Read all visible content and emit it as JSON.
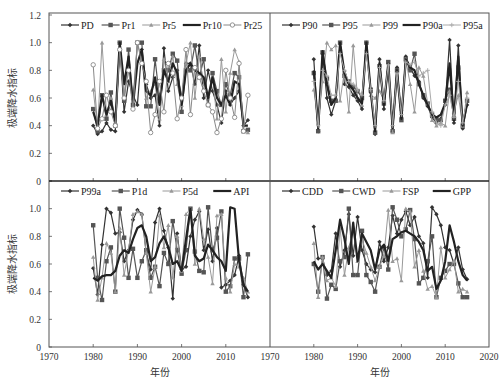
{
  "chart_data": [
    {
      "type": "line",
      "panel": "top-left",
      "title": "",
      "xlabel": "",
      "ylabel": "极端降水指标",
      "xlim": [
        1970,
        2020
      ],
      "ylim": [
        0,
        1.2
      ],
      "yticks": [
        "0",
        "0.2",
        "0.4",
        "0.6",
        "0.8",
        "1.0",
        "1.2"
      ],
      "xticks": [],
      "grid": false,
      "legend_position": "top",
      "x": [
        1980,
        1981,
        1982,
        1983,
        1984,
        1985,
        1986,
        1987,
        1988,
        1989,
        1990,
        1991,
        1992,
        1993,
        1994,
        1995,
        1996,
        1997,
        1998,
        1999,
        2000,
        2001,
        2002,
        2003,
        2004,
        2005,
        2006,
        2007,
        2008,
        2009,
        2010,
        2011,
        2012,
        2013,
        2014,
        2015
      ],
      "series": [
        {
          "name": "PD",
          "marker": "diamond",
          "color": "#333333",
          "width": 1.2,
          "values": [
            0.4,
            0.34,
            0.36,
            0.42,
            0.37,
            0.36,
            1.0,
            0.5,
            0.72,
            0.62,
            0.55,
            0.95,
            0.7,
            0.6,
            0.62,
            0.4,
            0.96,
            0.65,
            0.75,
            0.8,
            0.6,
            0.85,
            0.85,
            0.7,
            0.98,
            0.6,
            0.8,
            0.65,
            0.55,
            0.42,
            0.65,
            0.55,
            0.6,
            0.65,
            0.4,
            0.44
          ]
        },
        {
          "name": "Pr1",
          "marker": "square",
          "color": "#555555",
          "width": 1.2,
          "values": [
            0.52,
            0.36,
            0.62,
            0.45,
            0.64,
            0.4,
            1.0,
            0.58,
            0.95,
            0.55,
            1.0,
            1.0,
            0.54,
            0.54,
            0.88,
            0.6,
            0.8,
            0.8,
            0.92,
            0.87,
            0.5,
            0.8,
            0.8,
            0.98,
            0.75,
            0.88,
            0.55,
            0.78,
            0.65,
            0.55,
            0.7,
            0.62,
            0.78,
            0.75,
            0.36,
            0.37
          ]
        },
        {
          "name": "Pr5",
          "marker": "triangle",
          "color": "#999999",
          "width": 1.0,
          "values": [
            0.66,
            0.38,
            1.0,
            0.48,
            0.6,
            0.42,
            0.95,
            0.62,
            0.85,
            0.6,
            1.0,
            0.88,
            0.6,
            0.65,
            0.7,
            0.45,
            0.88,
            0.72,
            0.9,
            0.7,
            0.55,
            0.85,
            1.0,
            0.6,
            0.9,
            0.7,
            0.62,
            0.75,
            0.45,
            0.88,
            0.5,
            0.78,
            0.95,
            0.86,
            0.36,
            0.35
          ]
        },
        {
          "name": "Pr10",
          "marker": "none",
          "color": "#222222",
          "width": 2.2,
          "values": [
            0.5,
            0.4,
            0.62,
            0.48,
            0.58,
            0.42,
            1.0,
            0.7,
            0.9,
            0.55,
            0.85,
            0.95,
            0.65,
            0.62,
            0.75,
            0.55,
            0.8,
            0.72,
            0.85,
            0.78,
            0.55,
            0.8,
            0.85,
            0.8,
            0.78,
            0.75,
            0.6,
            0.75,
            0.6,
            0.55,
            0.62,
            0.55,
            0.72,
            0.7,
            0.4,
            0.4
          ]
        },
        {
          "name": "Pr25",
          "marker": "circle",
          "color": "#888888",
          "width": 1.0,
          "values": [
            0.84,
            0.38,
            0.45,
            0.62,
            0.5,
            0.4,
            0.95,
            0.6,
            0.8,
            0.52,
            1.0,
            0.85,
            0.72,
            0.35,
            0.48,
            0.72,
            0.5,
            0.85,
            0.78,
            0.45,
            0.6,
            0.95,
            0.48,
            0.82,
            0.75,
            0.65,
            0.55,
            0.5,
            0.35,
            0.45,
            0.8,
            0.6,
            0.46,
            0.85,
            0.36,
            0.62
          ]
        }
      ]
    },
    {
      "type": "line",
      "panel": "top-right",
      "title": "",
      "xlabel": "",
      "ylabel": "",
      "xlim": [
        1970,
        2020
      ],
      "ylim": [
        0,
        1.2
      ],
      "yticks": [],
      "xticks": [],
      "grid": false,
      "legend_position": "top",
      "x": [
        1980,
        1981,
        1982,
        1983,
        1984,
        1985,
        1986,
        1987,
        1988,
        1989,
        1990,
        1991,
        1992,
        1993,
        1994,
        1995,
        1996,
        1997,
        1998,
        1999,
        2000,
        2001,
        2002,
        2003,
        2004,
        2005,
        2006,
        2007,
        2008,
        2009,
        2010,
        2011,
        2012,
        2013,
        2014,
        2015
      ],
      "series": [
        {
          "name": "P90",
          "marker": "diamond",
          "color": "#333333",
          "width": 1.2,
          "values": [
            0.88,
            0.36,
            0.92,
            0.6,
            0.48,
            0.58,
            1.0,
            0.7,
            0.68,
            0.62,
            0.58,
            0.52,
            1.0,
            0.64,
            0.34,
            0.88,
            0.52,
            0.85,
            0.36,
            0.82,
            0.46,
            0.9,
            0.82,
            0.76,
            0.72,
            0.6,
            0.54,
            0.46,
            0.42,
            0.45,
            0.55,
            1.02,
            0.42,
            0.98,
            0.38,
            0.55
          ]
        },
        {
          "name": "P95",
          "marker": "square",
          "color": "#555555",
          "width": 1.2,
          "values": [
            0.78,
            0.36,
            0.93,
            0.74,
            0.58,
            0.58,
            1.0,
            0.76,
            0.72,
            0.68,
            0.65,
            0.6,
            1.0,
            0.66,
            0.35,
            0.83,
            0.56,
            0.86,
            0.36,
            0.8,
            0.44,
            0.88,
            0.8,
            0.92,
            0.7,
            0.62,
            0.56,
            0.48,
            0.45,
            0.44,
            0.58,
            0.66,
            0.45,
            0.82,
            0.4,
            0.58
          ]
        },
        {
          "name": "P99",
          "marker": "triangle",
          "color": "#999999",
          "width": 1.0,
          "values": [
            0.66,
            0.42,
            0.72,
            1.0,
            0.95,
            0.98,
            0.58,
            0.8,
            0.5,
            0.98,
            0.6,
            0.55,
            0.95,
            0.62,
            0.6,
            0.65,
            0.58,
            0.8,
            0.35,
            0.74,
            0.52,
            0.88,
            0.7,
            0.5,
            0.82,
            0.76,
            0.56,
            0.44,
            0.4,
            0.42,
            0.4,
            0.65,
            0.5,
            0.62,
            0.4,
            0.64
          ]
        },
        {
          "name": "P90a",
          "marker": "none",
          "color": "#222222",
          "width": 2.2,
          "values": [
            0.8,
            0.38,
            0.94,
            0.7,
            0.55,
            0.6,
            1.0,
            0.78,
            0.7,
            0.66,
            0.6,
            0.56,
            1.0,
            0.65,
            0.36,
            0.85,
            0.55,
            0.85,
            0.38,
            0.8,
            0.45,
            0.88,
            0.82,
            0.8,
            0.7,
            0.62,
            0.55,
            0.48,
            0.46,
            0.48,
            0.56,
            0.85,
            0.44,
            0.9,
            0.4,
            0.56
          ]
        },
        {
          "name": "P95a",
          "marker": "plus",
          "color": "#aaaaaa",
          "width": 1.0,
          "values": [
            0.72,
            0.4,
            0.8,
            0.76,
            0.62,
            0.62,
            0.92,
            0.8,
            0.72,
            0.7,
            0.66,
            0.62,
            0.92,
            0.66,
            0.4,
            0.82,
            0.58,
            0.84,
            0.4,
            0.78,
            0.48,
            0.86,
            0.84,
            0.86,
            0.76,
            0.78,
            0.8,
            0.5,
            0.42,
            0.4,
            0.55,
            0.62,
            0.46,
            0.72,
            0.42,
            0.6
          ]
        }
      ]
    },
    {
      "type": "line",
      "panel": "bottom-left",
      "title": "",
      "xlabel": "年份",
      "ylabel": "极端降水指标",
      "xlim": [
        1970,
        2020
      ],
      "ylim": [
        0,
        1.2
      ],
      "yticks": [
        "0",
        "0.2",
        "0.4",
        "0.6",
        "0.8",
        "1.0"
      ],
      "xticks": [
        "1970",
        "1980",
        "1990",
        "2000",
        "2010"
      ],
      "grid": false,
      "legend_position": "top",
      "x": [
        1980,
        1981,
        1982,
        1983,
        1984,
        1985,
        1986,
        1987,
        1988,
        1989,
        1990,
        1991,
        1992,
        1993,
        1994,
        1995,
        1996,
        1997,
        1998,
        1999,
        2000,
        2001,
        2002,
        2003,
        2004,
        2005,
        2006,
        2007,
        2008,
        2009,
        2010,
        2011,
        2012,
        2013,
        2014,
        2015
      ],
      "series": [
        {
          "name": "P99a",
          "marker": "diamond",
          "color": "#333333",
          "width": 1.2,
          "values": [
            0.57,
            0.38,
            0.74,
            1.0,
            0.97,
            0.82,
            0.83,
            0.62,
            0.7,
            0.92,
            0.99,
            0.96,
            0.68,
            0.56,
            0.9,
            1.0,
            0.84,
            0.72,
            0.35,
            0.82,
            0.56,
            0.58,
            0.8,
            0.92,
            0.98,
            0.7,
            0.85,
            0.62,
            0.86,
            0.43,
            0.45,
            0.48,
            0.52,
            0.66,
            0.45,
            0.36
          ]
        },
        {
          "name": "P1d",
          "marker": "square",
          "color": "#555555",
          "width": 1.2,
          "values": [
            0.88,
            0.5,
            0.34,
            0.62,
            0.72,
            0.4,
            1.0,
            0.79,
            0.5,
            0.71,
            0.5,
            0.62,
            0.7,
            0.5,
            0.58,
            0.44,
            0.68,
            0.6,
            0.91,
            0.7,
            0.53,
            0.7,
            1.0,
            0.69,
            0.55,
            0.54,
            1.01,
            0.7,
            0.79,
            0.98,
            0.4,
            0.44,
            0.64,
            0.64,
            0.36,
            0.67
          ]
        },
        {
          "name": "P5d",
          "marker": "triangle",
          "color": "#999999",
          "width": 1.0,
          "values": [
            0.65,
            0.34,
            0.5,
            0.75,
            0.68,
            0.4,
            0.86,
            0.52,
            0.7,
            0.96,
            0.98,
            0.96,
            0.68,
            0.4,
            0.58,
            0.95,
            0.72,
            0.88,
            0.5,
            0.8,
            0.55,
            0.96,
            1.0,
            0.6,
            1.0,
            0.78,
            0.65,
            0.46,
            0.95,
            0.96,
            0.5,
            0.4,
            0.6,
            0.58,
            0.5,
            0.4
          ]
        },
        {
          "name": "API",
          "marker": "none",
          "color": "#222222",
          "width": 2.2,
          "values": [
            0.5,
            0.48,
            0.51,
            0.52,
            0.52,
            0.55,
            0.66,
            0.7,
            0.68,
            0.78,
            0.86,
            0.88,
            0.8,
            0.62,
            0.65,
            0.75,
            0.8,
            0.72,
            0.6,
            0.62,
            0.55,
            0.78,
            1.0,
            0.66,
            0.62,
            0.64,
            0.74,
            0.7,
            0.65,
            0.62,
            0.55,
            1.01,
            1.0,
            0.62,
            0.45,
            0.4
          ]
        }
      ]
    },
    {
      "type": "line",
      "panel": "bottom-right",
      "title": "",
      "xlabel": "年份",
      "ylabel": "",
      "xlim": [
        1970,
        2020
      ],
      "ylim": [
        0,
        1.2
      ],
      "yticks": [],
      "xticks": [
        "1970",
        "1980",
        "1990",
        "2000",
        "2010",
        "2020"
      ],
      "grid": false,
      "legend_position": "top",
      "x": [
        1980,
        1981,
        1982,
        1983,
        1984,
        1985,
        1986,
        1987,
        1988,
        1989,
        1990,
        1991,
        1992,
        1993,
        1994,
        1995,
        1996,
        1997,
        1998,
        1999,
        2000,
        2001,
        2002,
        2003,
        2004,
        2005,
        2006,
        2007,
        2008,
        2009,
        2010,
        2011,
        2012,
        2013,
        2014,
        2015
      ],
      "series": [
        {
          "name": "CDD",
          "marker": "diamond",
          "color": "#333333",
          "width": 1.2,
          "values": [
            0.87,
            0.64,
            0.64,
            0.52,
            0.55,
            0.82,
            0.58,
            0.7,
            0.96,
            0.66,
            0.94,
            0.7,
            0.6,
            0.56,
            0.54,
            0.76,
            0.62,
            0.72,
            0.95,
            0.82,
            0.92,
            0.98,
            0.88,
            0.94,
            0.8,
            0.75,
            0.5,
            1.01,
            0.96,
            0.88,
            0.72,
            0.7,
            0.6,
            0.72,
            0.56,
            0.49
          ]
        },
        {
          "name": "CWD",
          "marker": "square",
          "color": "#555555",
          "width": 1.2,
          "values": [
            0.6,
            0.4,
            0.65,
            0.35,
            0.45,
            0.42,
            0.62,
            0.65,
            1.0,
            0.52,
            0.52,
            0.84,
            0.52,
            0.47,
            0.4,
            0.58,
            0.72,
            0.56,
            1.01,
            0.92,
            0.8,
            0.85,
            0.99,
            0.78,
            0.46,
            0.5,
            0.62,
            0.8,
            0.36,
            0.5,
            0.55,
            0.6,
            0.6,
            0.46,
            0.36,
            0.36
          ]
        },
        {
          "name": "FSP",
          "marker": "triangle",
          "color": "#999999",
          "width": 1.0,
          "values": [
            0.75,
            0.36,
            0.65,
            0.48,
            0.5,
            0.44,
            0.86,
            0.52,
            0.72,
            0.84,
            0.62,
            0.78,
            0.68,
            0.58,
            0.48,
            0.58,
            0.66,
            0.99,
            0.62,
            0.64,
            0.48,
            1.0,
            0.98,
            0.58,
            0.7,
            0.55,
            0.42,
            0.44,
            0.36,
            0.72,
            0.5,
            0.56,
            0.62,
            0.4,
            0.42,
            0.4
          ]
        },
        {
          "name": "GPP",
          "marker": "none",
          "color": "#222222",
          "width": 2.2,
          "values": [
            0.62,
            0.56,
            0.6,
            0.55,
            0.5,
            0.7,
            0.92,
            0.78,
            0.6,
            0.9,
            0.62,
            0.82,
            0.76,
            0.7,
            0.56,
            0.7,
            0.74,
            0.62,
            0.78,
            0.8,
            0.83,
            0.84,
            0.82,
            0.8,
            0.76,
            0.7,
            0.55,
            0.58,
            0.42,
            0.48,
            0.62,
            0.88,
            0.76,
            0.62,
            0.52,
            0.48
          ]
        }
      ]
    }
  ],
  "axis": {
    "ylabel": "极端降水指标",
    "xlabel": "年份"
  }
}
